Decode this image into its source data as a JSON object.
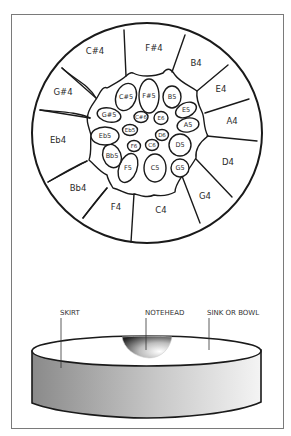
{
  "figure": {
    "top_view": {
      "outer_notes": [
        "C#4",
        "F#4",
        "B4",
        "E4",
        "A4",
        "D4",
        "G4",
        "C4",
        "F4",
        "Bb4",
        "Eb4",
        "G#4"
      ],
      "middle_notes": [
        "C#5",
        "F#5",
        "B5",
        "E5",
        "A5",
        "D5",
        "G5",
        "C5",
        "F5",
        "Bb5",
        "Eb5",
        "G#5"
      ],
      "inner_notes": [
        "C#6",
        "E6",
        "D6",
        "C6",
        "F6",
        "Eb5"
      ]
    },
    "side_view": {
      "labels": {
        "skirt": "SKIRT",
        "notehead": "NOTEHEAD",
        "sink": "SINK OR BOWL"
      }
    }
  },
  "colors": {
    "line": "#1a1a1a",
    "frame": "#7a7a7a",
    "skirt_dark": "#8a8a8a",
    "skirt_light": "#f2f2f2"
  }
}
